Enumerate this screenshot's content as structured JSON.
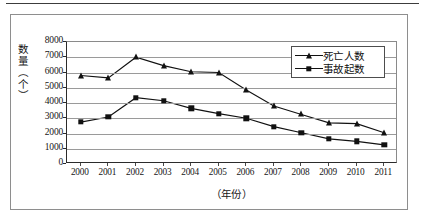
{
  "chart_data": {
    "type": "line",
    "title": "",
    "xlabel": "（年份）",
    "ylabel": "数量（个）",
    "categories": [
      "2000",
      "2001",
      "2002",
      "2003",
      "2004",
      "2005",
      "2006",
      "2007",
      "2008",
      "2009",
      "2010",
      "2011"
    ],
    "ylim": [
      0,
      8000
    ],
    "ytick_values": [
      0,
      1000,
      2000,
      3000,
      4000,
      5000,
      6000,
      7000,
      8000
    ],
    "ytick_labels": [
      "0",
      "1000",
      "2000",
      "3000",
      "4000",
      "5000",
      "6000",
      "7000",
      "8000"
    ],
    "grid": true,
    "legend_position": "top-right",
    "series": [
      {
        "name": "死亡人数",
        "marker": "triangle",
        "color": "#111111",
        "values": [
          5800,
          5650,
          7000,
          6450,
          6050,
          6000,
          4850,
          3800,
          3250,
          2700,
          2650,
          2050
        ]
      },
      {
        "name": "事故起数",
        "marker": "square",
        "color": "#111111",
        "values": [
          2750,
          3080,
          4350,
          4150,
          3650,
          3300,
          3000,
          2450,
          2050,
          1650,
          1480,
          1250
        ]
      }
    ]
  },
  "axes": {
    "y_title": "数量（个）",
    "x_title": "（年份）"
  },
  "legend": {
    "items": [
      {
        "label": "死亡人数",
        "marker": "triangle"
      },
      {
        "label": "事故起数",
        "marker": "square"
      }
    ]
  },
  "colors": {
    "ink": "#111111",
    "grid": "#9a9a9a",
    "frame": "#8e8e8e",
    "background": "#ffffff"
  }
}
